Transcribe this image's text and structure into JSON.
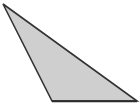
{
  "figure": {
    "name": "triangle-figure",
    "type": "polygon",
    "shape_label": "triangle",
    "classification": "obtuse scalene triangle",
    "canvas": {
      "width": 140,
      "height": 108,
      "background_color": "#ffffff"
    },
    "style": {
      "fill_color": "#cfcfcf",
      "stroke_color": "#333333",
      "base_stroke_color": "#2b2b2b",
      "stroke_width": 1.6,
      "base_stroke_width": 2.0
    },
    "vertices": [
      {
        "label": "A",
        "x": 3,
        "y": 4
      },
      {
        "label": "B",
        "x": 137,
        "y": 101
      },
      {
        "label": "C",
        "x": 52,
        "y": 101
      }
    ],
    "points_attr": "3,4 137,101 52,101",
    "base_line": {
      "x1": 52,
      "y1": 101,
      "x2": 137,
      "y2": 101
    },
    "labels": []
  },
  "chart_data": {
    "type": "scatter",
    "title": "",
    "xlabel": "",
    "ylabel": "",
    "grid": false,
    "legend": "none",
    "xlim": [
      0,
      140
    ],
    "ylim": [
      0,
      108
    ],
    "series": [
      {
        "name": "triangle",
        "x": [
          3,
          137,
          52,
          3
        ],
        "y": [
          4,
          101,
          101,
          4
        ]
      }
    ]
  }
}
